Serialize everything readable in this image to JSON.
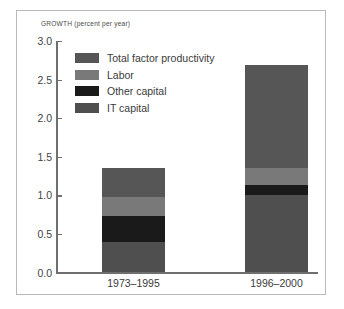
{
  "chart_data": {
    "type": "bar",
    "stacked": true,
    "title": "",
    "subtitle": "",
    "axis_title": "GROWTH (percent per year)",
    "xlabel": "",
    "ylabel": "GROWTH (percent per year)",
    "ylim": [
      0.0,
      3.0
    ],
    "ytick_labels": [
      "0.0",
      "0.5",
      "1.0",
      "1.5",
      "2.0",
      "2.5",
      "3.0"
    ],
    "ytick_values": [
      0.0,
      0.5,
      1.0,
      1.5,
      2.0,
      2.5,
      3.0
    ],
    "grid": false,
    "legend_position": "inside-top-left",
    "categories": [
      "1973–1995",
      "1996–2000"
    ],
    "series": [
      {
        "name": "Total factor productivity",
        "color": "#565656",
        "values": [
          0.38,
          1.33
        ]
      },
      {
        "name": "Labor",
        "color": "#797979",
        "values": [
          0.25,
          0.22
        ]
      },
      {
        "name": "Other capital",
        "color": "#1a1a1a",
        "values": [
          0.34,
          0.14
        ]
      },
      {
        "name": "IT capital",
        "color": "#4f4f4f",
        "values": [
          0.39,
          1.0
        ]
      }
    ],
    "totals": [
      1.36,
      2.69
    ],
    "stack_order_bottom_to_top": [
      "IT capital",
      "Other capital",
      "Labor",
      "Total factor productivity"
    ]
  },
  "colors": {
    "frame_border": "#b9b9b9",
    "axis": "#6f6f6f",
    "text": "#3b3b3b",
    "background": "#ffffff"
  }
}
